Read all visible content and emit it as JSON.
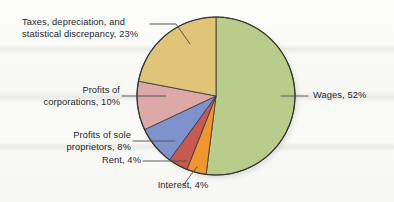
{
  "figure": {
    "type": "pie-chart",
    "background_color": "#f8f8f5",
    "outline_color": "#3a3a3a"
  },
  "chart_data": {
    "type": "pie",
    "title": "",
    "subtitle": "",
    "xlabel": "",
    "ylabel": "",
    "legend_position": "callout-labels",
    "grid": false,
    "start_angle_deg": 0,
    "direction": "clockwise",
    "total": 101,
    "units": "percent",
    "categories": [
      "Wages",
      "Interest",
      "Rent",
      "Profits of sole proprietors",
      "Profits of corporations",
      "Taxes, depreciation, and statistical discrepancy"
    ],
    "values": [
      52,
      4,
      4,
      8,
      10,
      23
    ],
    "colors": [
      "#b9cc8c",
      "#f0962f",
      "#c8594f",
      "#8092cc",
      "#dda8a8",
      "#e0c578"
    ],
    "slices": [
      {
        "label": "Wages, 52%",
        "name": "Wages",
        "value": 52,
        "color": "#b9cc8c",
        "start_deg": 0,
        "end_deg": 187.2
      },
      {
        "label": "Interest, 4%",
        "name": "Interest",
        "value": 4,
        "color": "#f0962f",
        "start_deg": 187.2,
        "end_deg": 201.6
      },
      {
        "label": "Rent, 4%",
        "name": "Rent",
        "value": 4,
        "color": "#c8594f",
        "start_deg": 201.6,
        "end_deg": 216.0
      },
      {
        "label": "Profits of sole proprietors, 8%",
        "name": "Profits of sole proprietors",
        "value": 8,
        "color": "#8092cc",
        "start_deg": 216.0,
        "end_deg": 244.8
      },
      {
        "label": "Profits of corporations, 10%",
        "name": "Profits of corporations",
        "value": 10,
        "color": "#dda8a8",
        "start_deg": 244.8,
        "end_deg": 280.8
      },
      {
        "label": "Taxes, depreciation, and statistical discrepancy, 23%",
        "name": "Taxes, depreciation, and statistical discrepancy",
        "value": 23,
        "color": "#e0c578",
        "start_deg": 280.8,
        "end_deg": 360.0
      }
    ]
  },
  "labels": {
    "taxes_line1": "Taxes, depreciation, and",
    "taxes_line2": "statistical discrepancy, 23%",
    "corporations_line1": "Profits of",
    "corporations_line2": "corporations, 10%",
    "proprietors_line1": "Profits of sole",
    "proprietors_line2": "proprietors, 8%",
    "rent": "Rent, 4%",
    "interest": "Interest, 4%",
    "wages": "Wages, 52%"
  }
}
